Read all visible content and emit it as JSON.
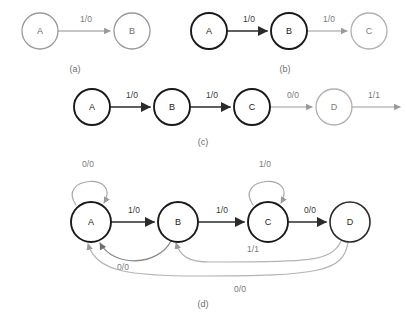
{
  "figure": {
    "width": 407,
    "height": 326,
    "background": "#ffffff",
    "colors": {
      "dark": "#1a1a1a",
      "gray": "#9a9a9a",
      "mid_gray": "#7a7a7a",
      "label_dark": "#3a3a3a",
      "caption": "#6e6e6e"
    }
  },
  "panels": [
    {
      "id": "a",
      "caption": "(a)",
      "caption_x": 75,
      "caption_y": 70,
      "nodes": [
        {
          "id": "a-A",
          "label": "A",
          "cx": 40,
          "cy": 31,
          "r": 18,
          "color": "#9a9a9a",
          "stroke_width": 1.3,
          "text_color": "#6e6e6e"
        },
        {
          "id": "a-B",
          "label": "B",
          "cx": 132,
          "cy": 31,
          "r": 18,
          "color": "#9a9a9a",
          "stroke_width": 1.3,
          "text_color": "#6e6e6e"
        }
      ],
      "edges": [
        {
          "id": "a-A-B",
          "from": "A",
          "to": "B",
          "label": "1/0",
          "label_x": 86,
          "label_y": 20,
          "color": "#8d8d8d",
          "stroke_width": 1.2,
          "path": "M 58 31 L 110 31",
          "arrow": "light"
        }
      ]
    },
    {
      "id": "b",
      "caption": "(b)",
      "caption_x": 285,
      "caption_y": 70,
      "nodes": [
        {
          "id": "b-A",
          "label": "A",
          "cx": 209,
          "cy": 31,
          "r": 18,
          "color": "#1a1a1a",
          "stroke_width": 1.9,
          "text_color": "#1a1a1a"
        },
        {
          "id": "b-B",
          "label": "B",
          "cx": 289,
          "cy": 31,
          "r": 18,
          "color": "#1a1a1a",
          "stroke_width": 1.9,
          "text_color": "#1a1a1a"
        },
        {
          "id": "b-C",
          "label": "C",
          "cx": 369,
          "cy": 31,
          "r": 18,
          "color": "#b0b0b0",
          "stroke_width": 1.3,
          "text_color": "#7e7e7e"
        }
      ],
      "edges": [
        {
          "id": "b-A-B",
          "from": "A",
          "to": "B",
          "label": "1/0",
          "label_x": 249,
          "label_y": 20,
          "color": "#2b2b2b",
          "stroke_width": 1.7,
          "path": "M 227 31 L 267 31",
          "arrow": "dark"
        },
        {
          "id": "b-B-C",
          "from": "B",
          "to": "C",
          "label": "1/0",
          "label_x": 329,
          "label_y": 20,
          "color": "#9a9a9a",
          "stroke_width": 1.2,
          "path": "M 307 31 L 347 31",
          "arrow": "light"
        }
      ]
    },
    {
      "id": "c",
      "caption": "(c)",
      "caption_x": 203,
      "caption_y": 143,
      "nodes": [
        {
          "id": "c-A",
          "label": "A",
          "cx": 92,
          "cy": 107,
          "r": 18,
          "color": "#1a1a1a",
          "stroke_width": 1.9,
          "text_color": "#1a1a1a"
        },
        {
          "id": "c-B",
          "label": "B",
          "cx": 172,
          "cy": 107,
          "r": 18,
          "color": "#1a1a1a",
          "stroke_width": 1.9,
          "text_color": "#1a1a1a"
        },
        {
          "id": "c-C",
          "label": "C",
          "cx": 252,
          "cy": 107,
          "r": 18,
          "color": "#1a1a1a",
          "stroke_width": 1.9,
          "text_color": "#1a1a1a"
        },
        {
          "id": "c-D",
          "label": "D",
          "cx": 334,
          "cy": 107,
          "r": 18,
          "color": "#b0b0b0",
          "stroke_width": 1.3,
          "text_color": "#7e7e7e"
        }
      ],
      "edges": [
        {
          "id": "c-A-B",
          "from": "A",
          "to": "B",
          "label": "1/0",
          "label_x": 132,
          "label_y": 96,
          "color": "#2b2b2b",
          "stroke_width": 1.7,
          "path": "M 110 107 L 150 107",
          "arrow": "dark"
        },
        {
          "id": "c-B-C",
          "from": "B",
          "to": "C",
          "label": "1/0",
          "label_x": 212,
          "label_y": 96,
          "color": "#2b2b2b",
          "stroke_width": 1.7,
          "path": "M 190 107 L 230 107",
          "arrow": "dark"
        },
        {
          "id": "c-C-D",
          "from": "C",
          "to": "D",
          "label": "0/0",
          "label_x": 293,
          "label_y": 96,
          "color": "#9a9a9a",
          "stroke_width": 1.2,
          "path": "M 270 107 L 312 107",
          "arrow": "light"
        },
        {
          "id": "c-D-out",
          "from": "D",
          "to": "out",
          "label": "1/1",
          "label_x": 374,
          "label_y": 96,
          "color": "#9a9a9a",
          "stroke_width": 1.2,
          "path": "M 352 107 L 400 107",
          "arrow": "light"
        }
      ]
    },
    {
      "id": "d",
      "caption": "(d)",
      "caption_x": 203,
      "caption_y": 305,
      "nodes": [
        {
          "id": "d-A",
          "label": "A",
          "cx": 91,
          "cy": 222,
          "r": 20,
          "color": "#1a1a1a",
          "stroke_width": 1.9,
          "text_color": "#1a1a1a"
        },
        {
          "id": "d-B",
          "label": "B",
          "cx": 178,
          "cy": 222,
          "r": 20,
          "color": "#1a1a1a",
          "stroke_width": 1.9,
          "text_color": "#1a1a1a"
        },
        {
          "id": "d-C",
          "label": "C",
          "cx": 268,
          "cy": 222,
          "r": 20,
          "color": "#1a1a1a",
          "stroke_width": 1.9,
          "text_color": "#1a1a1a"
        },
        {
          "id": "d-D",
          "label": "D",
          "cx": 350,
          "cy": 222,
          "r": 20,
          "color": "#2b2b2b",
          "stroke_width": 1.6,
          "text_color": "#2b2b2b"
        }
      ],
      "edges": [
        {
          "id": "d-A-self",
          "from": "A",
          "to": "A",
          "label": "0/0",
          "label_x": 88,
          "label_y": 165,
          "color": "#a8a8a8",
          "stroke_width": 1.2,
          "path": "M 76 205 C 56 176, 122 172, 104 203",
          "arrow": "light"
        },
        {
          "id": "d-A-B",
          "from": "A",
          "to": "B",
          "label": "1/0",
          "label_x": 134,
          "label_y": 211,
          "color": "#2b2b2b",
          "stroke_width": 1.7,
          "path": "M 111 222 L 154 222",
          "arrow": "dark"
        },
        {
          "id": "d-B-C",
          "from": "B",
          "to": "C",
          "label": "1/0",
          "label_x": 222,
          "label_y": 211,
          "color": "#2b2b2b",
          "stroke_width": 1.7,
          "path": "M 198 222 L 244 222",
          "arrow": "dark"
        },
        {
          "id": "d-C-self",
          "from": "C",
          "to": "C",
          "label": "1/0",
          "label_x": 265,
          "label_y": 165,
          "color": "#a8a8a8",
          "stroke_width": 1.2,
          "path": "M 253 205 C 233 176, 299 172, 281 203",
          "arrow": "light"
        },
        {
          "id": "d-C-D",
          "from": "C",
          "to": "D",
          "label": "0/0",
          "label_x": 310,
          "label_y": 211,
          "color": "#2b2b2b",
          "stroke_width": 1.7,
          "path": "M 288 222 L 326 222",
          "arrow": "dark"
        },
        {
          "id": "d-B-A",
          "from": "B",
          "to": "A",
          "label": "0/0",
          "label_x": 123,
          "label_y": 268,
          "color": "#8a8a8a",
          "stroke_width": 1.3,
          "path": "M 171 241 C 158 266, 114 268, 100 243",
          "arrow": "mid"
        },
        {
          "id": "d-D-B",
          "from": "D",
          "to": "B",
          "label": "1/1",
          "label_x": 253,
          "label_y": 250,
          "color": "#b4b4b4",
          "stroke_width": 1.2,
          "path": "M 341 241 C 332 263, 300 262, 210 262 C 188 262, 180 256, 176 243",
          "arrow": "light"
        },
        {
          "id": "d-D-A",
          "from": "D",
          "to": "A",
          "label": "0/0",
          "label_x": 240,
          "label_y": 290,
          "color": "#b4b4b4",
          "stroke_width": 1.2,
          "path": "M 348 242 C 344 272, 318 276, 200 276 C 130 276, 96 272, 88 244",
          "arrow": "light"
        }
      ]
    }
  ]
}
